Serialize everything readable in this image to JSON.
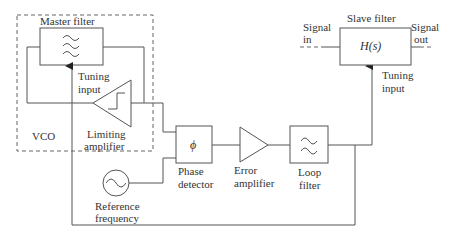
{
  "diagram": {
    "vco_group": {
      "label": "VCO",
      "master_filter": {
        "label": "Master filter",
        "icon": "bandpass-filter-icon"
      },
      "master_tuning_label_1": "Tuning",
      "master_tuning_label_2": "input",
      "limiting_amplifier_label_1": "Limiting",
      "limiting_amplifier_label_2": "amplifier"
    },
    "phase_detector": {
      "symbol": "ϕ",
      "label_1": "Phase",
      "label_2": "detector"
    },
    "error_amplifier": {
      "label_1": "Error",
      "label_2": "amplifier"
    },
    "loop_filter": {
      "label_1": "Loop",
      "label_2": "filter",
      "icon": "lowpass-filter-icon"
    },
    "reference": {
      "label_1": "Reference",
      "label_2": "frequency",
      "icon": "sine-oscillator-icon"
    },
    "slave_filter": {
      "label": "Slave filter",
      "transfer": "H(s)",
      "signal_in_1": "Signal",
      "signal_in_2": "in",
      "signal_out_1": "Signal",
      "signal_out_2": "out",
      "tuning_label_1": "Tuning",
      "tuning_label_2": "input"
    }
  }
}
